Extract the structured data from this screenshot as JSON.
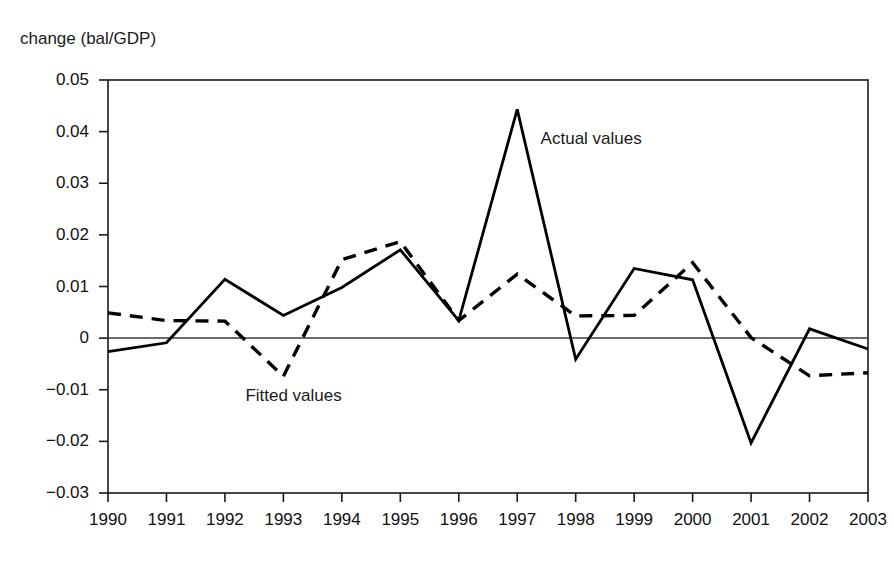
{
  "chart_data": {
    "type": "line",
    "title": "",
    "subtitle": "",
    "ylabel": "change (bal/GDP)",
    "xlabel": "",
    "grid": false,
    "legend_position": "inline-annotations",
    "x": [
      1990,
      1991,
      1992,
      1993,
      1994,
      1995,
      1996,
      1997,
      1998,
      1999,
      2000,
      2001,
      2002,
      2003
    ],
    "categories": [
      "1990",
      "1991",
      "1992",
      "1993",
      "1994",
      "1995",
      "1996",
      "1997",
      "1998",
      "1999",
      "2000",
      "2001",
      "2002",
      "2003"
    ],
    "xlim": [
      1990,
      2003
    ],
    "ylim": [
      -0.03,
      0.05
    ],
    "yticks": [
      0.05,
      0.04,
      0.03,
      0.02,
      0.01,
      0,
      -0.01,
      -0.02,
      -0.03
    ],
    "ytick_labels": [
      "0.05",
      "0.04",
      "0.03",
      "0.02",
      "0.01",
      "0",
      "−0.01",
      "−0.02",
      "−0.03"
    ],
    "zero_line": 0,
    "series": [
      {
        "name": "Actual values",
        "style": "solid",
        "color": "#000000",
        "values": [
          -0.0026,
          -0.0009,
          0.0114,
          0.0044,
          0.0098,
          0.0171,
          0.0034,
          0.0443,
          -0.0041,
          0.0135,
          0.0113,
          -0.0203,
          0.0018,
          -0.0021
        ]
      },
      {
        "name": "Fitted values",
        "style": "dashed",
        "color": "#000000",
        "values": [
          0.0049,
          0.0034,
          0.0033,
          -0.0074,
          0.0152,
          0.0187,
          0.0034,
          0.0124,
          0.0043,
          0.0044,
          0.0146,
          0.0001,
          -0.0073,
          -0.0067
        ]
      }
    ],
    "annotations": [
      {
        "text": "Actual values",
        "x": 1997.4,
        "y": 0.0385
      },
      {
        "text": "Fitted values",
        "x": 1992.35,
        "y": -0.0113
      }
    ]
  },
  "axis": {
    "ylabel": "change (bal/GDP)"
  }
}
